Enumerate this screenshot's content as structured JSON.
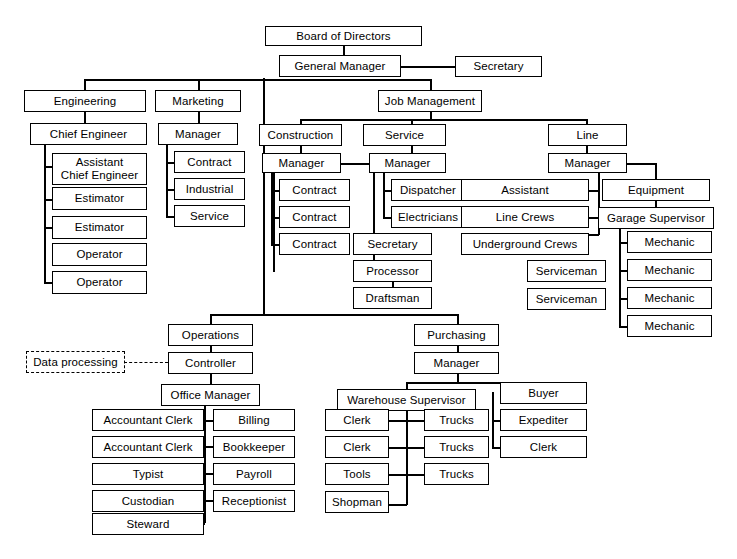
{
  "chart": {
    "type": "org-chart",
    "colors": {
      "box_border": "#000000",
      "box_fill": "#ffffff",
      "line": "#000000",
      "text": "#000000",
      "background": "#ffffff"
    },
    "nodes": {
      "board_of_directors": "Board of Directors",
      "general_manager": "General Manager",
      "secretary_top": "Secretary",
      "engineering": "Engineering",
      "chief_engineer": "Chief Engineer",
      "assistant_chief_engineer": "Assistant\nChief Engineer",
      "estimator_1": "Estimator",
      "estimator_2": "Estimator",
      "operator_1": "Operator",
      "operator_2": "Operator",
      "marketing": "Marketing",
      "marketing_manager": "Manager",
      "marketing_contract": "Contract",
      "marketing_industrial": "Industrial",
      "marketing_service": "Service",
      "job_management": "Job Management",
      "construction": "Construction",
      "construction_manager": "Manager",
      "construction_contract_1": "Contract",
      "construction_contract_2": "Contract",
      "construction_contract_3": "Contract",
      "construction_secretary": "Secretary",
      "construction_processor": "Processor",
      "construction_draftsman": "Draftsman",
      "service": "Service",
      "service_manager": "Manager",
      "service_dispatcher": "Dispatcher",
      "service_electricians": "Electricians",
      "line": "Line",
      "line_manager": "Manager",
      "line_assistant": "Assistant",
      "line_crews": "Line Crews",
      "underground_crews": "Underground Crews",
      "serviceman_1": "Serviceman",
      "serviceman_2": "Serviceman",
      "equipment": "Equipment",
      "garage_supervisor": "Garage Supervisor",
      "mechanic_1": "Mechanic",
      "mechanic_2": "Mechanic",
      "mechanic_3": "Mechanic",
      "mechanic_4": "Mechanic",
      "operations": "Operations",
      "data_processing": "Data processing",
      "controller": "Controller",
      "office_manager": "Office Manager",
      "accountant_clerk_1": "Accountant Clerk",
      "accountant_clerk_2": "Accountant Clerk",
      "typist": "Typist",
      "custodian": "Custodian",
      "steward": "Steward",
      "billing": "Billing",
      "bookkeeper": "Bookkeeper",
      "payroll": "Payroll",
      "receptionist": "Receptionist",
      "purchasing": "Purchasing",
      "purchasing_manager": "Manager",
      "warehouse_supervisor": "Warehouse Supervisor",
      "warehouse_clerk_1": "Clerk",
      "warehouse_clerk_2": "Clerk",
      "warehouse_tools": "Tools",
      "warehouse_shopman": "Shopman",
      "trucks_1": "Trucks",
      "trucks_2": "Trucks",
      "trucks_3": "Trucks",
      "buyer": "Buyer",
      "expediter": "Expediter",
      "purchasing_clerk": "Clerk"
    }
  }
}
